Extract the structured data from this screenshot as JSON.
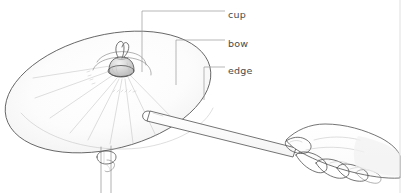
{
  "figure": {
    "style": "pencil line drawing",
    "width": 417,
    "height": 193,
    "background_color": "#ffffff"
  },
  "labels": [
    {
      "id": "cup",
      "text": "cup",
      "text_x": 228,
      "text_y": 18,
      "leader": "M 142,11 L 225,11",
      "leader_stem": "M 142,11 L 142,72",
      "pointer_x": 142,
      "pointer_y": 72
    },
    {
      "id": "bow",
      "text": "bow",
      "text_x": 228,
      "text_y": 47,
      "leader": "M 176,40 L 225,40",
      "leader_stem": "M 176,40 L 176,85",
      "pointer_x": 176,
      "pointer_y": 85
    },
    {
      "id": "edge",
      "text": "edge",
      "text_x": 228,
      "text_y": 74,
      "leader": "M 204,67 L 225,67",
      "leader_stem": "M 204,67 L 204,100",
      "pointer_x": 204,
      "pointer_y": 100
    }
  ],
  "parts": {
    "cymbal": {
      "name": "cymbal",
      "center_x": 108,
      "center_y": 92,
      "radius_x": 105,
      "radius_y": 57,
      "rotation_deg": -14
    },
    "cup": {
      "name": "cup",
      "center_x": 120,
      "center_y": 68
    },
    "wing_nut": {
      "name": "wing-nut",
      "center_x": 121,
      "center_y": 54
    },
    "stand": {
      "name": "cymbal-stand",
      "top_x": 105,
      "top_y": 148,
      "bottom_y": 193
    },
    "drumstick": {
      "name": "drumstick",
      "tip_x": 146,
      "tip_y": 115,
      "butt_x": 300,
      "butt_y": 155
    },
    "hand": {
      "name": "hand",
      "center_x": 340,
      "center_y": 152
    }
  },
  "colors": {
    "line": "#5b5b5b",
    "line_thin": "#7d7d7d",
    "line_faint": "#bcbcbc",
    "label_text": "#4a4a4a",
    "leader": "#9a9a9a",
    "frame": "#d7d7d7",
    "background": "#ffffff"
  },
  "frame": {
    "right_rule_x": 400,
    "show_right_rule": true
  }
}
